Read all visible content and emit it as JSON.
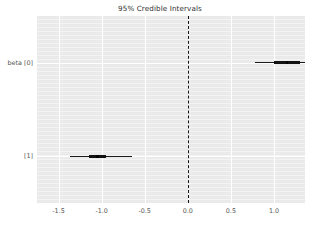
{
  "chart_data": {
    "type": "bar",
    "title": "95% Credible Intervals",
    "xlabel": "",
    "ylabel": "",
    "xlim": [
      -1.75,
      1.36
    ],
    "xticks": [
      -1.5,
      -1.0,
      -0.5,
      0.0,
      0.5,
      1.0
    ],
    "xtick_labels": [
      "-1.5",
      "-1.0",
      "-0.5",
      "0.0",
      "0.5",
      "1.0"
    ],
    "categories": [
      "beta [0]",
      "[1]"
    ],
    "grid": true,
    "legend": null,
    "reference_line": {
      "x": 0.0,
      "style": "dashed",
      "color": "#141414"
    },
    "series": [
      {
        "name": "beta [0]",
        "point_estimate": 1.15,
        "ci_95": [
          0.78,
          1.56
        ],
        "ci_50": [
          1.0,
          1.3
        ]
      },
      {
        "name": "[1]",
        "point_estimate": -1.05,
        "ci_95": [
          -1.37,
          -0.65
        ],
        "ci_50": [
          -1.15,
          -0.95
        ]
      }
    ],
    "colors": {
      "panel_background": "#eaeaea",
      "gridline": "#ffffff",
      "interval": "#1a1a1a",
      "reference_line": "#141414",
      "tick_label": "#555555",
      "title": "#303030"
    }
  },
  "caption": {
    "text": ""
  }
}
